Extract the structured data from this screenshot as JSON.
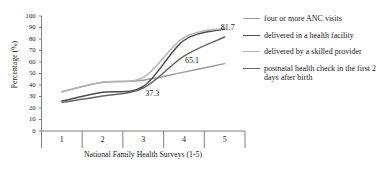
{
  "chart_data": {
    "type": "line",
    "title": "",
    "subtitle": "",
    "xlabel": "National Family Health Surveys (1-5)",
    "ylabel": "Percentage (%)",
    "categories": [
      "1",
      "2",
      "3",
      "4",
      "5"
    ],
    "xtick_labels": [
      "1",
      "2",
      "3",
      "4",
      "5"
    ],
    "ytick_labels": [
      "0",
      "10",
      "20",
      "30",
      "40",
      "50",
      "60",
      "70",
      "80",
      "90",
      "100"
    ],
    "ylim": [
      0,
      100
    ],
    "ytick_step": 10,
    "grid": false,
    "legend_position": "right",
    "series": [
      {
        "name": "four or more ANC visits",
        "color": "#9a9a9a",
        "values": [
          34.1,
          42.3,
          44.2,
          51.2,
          58.6
        ]
      },
      {
        "name": "delivered in a health facility",
        "color": "#4d4d4d",
        "values": [
          26.1,
          33.6,
          38.7,
          78.9,
          88.6
        ]
      },
      {
        "name": "delivered by a skilled provider",
        "color": "#b5b5b5",
        "values": [
          34.2,
          42.4,
          46.6,
          81.4,
          89.4
        ]
      },
      {
        "name": "postnatal health check in the first 2 days after birth",
        "color": "#666666",
        "values": [
          25.0,
          30.4,
          37.3,
          65.1,
          81.7
        ]
      }
    ],
    "annotations": [
      {
        "text": "37.3",
        "x_category": "3",
        "value": 37.3
      },
      {
        "text": "65.1",
        "x_category": "4",
        "value": 65.1
      },
      {
        "text": "81.7",
        "x_category": "5",
        "value": 81.7
      }
    ]
  },
  "legend": {
    "items": [
      {
        "label": "four or more ANC visits",
        "color": "#9a9a9a"
      },
      {
        "label": "delivered in a health facility",
        "color": "#4d4d4d"
      },
      {
        "label": "delivered by a skilled provider",
        "color": "#b5b5b5"
      },
      {
        "label": "postnatal health check in the first 2 days after birth",
        "color": "#666666"
      }
    ]
  }
}
